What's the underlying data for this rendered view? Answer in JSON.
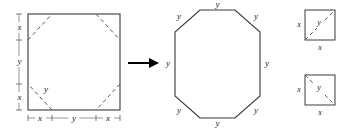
{
  "figure": {
    "colors": {
      "shape_stroke": "#3a3a3a",
      "dashed_stroke": "#5a5a5a",
      "axis_stroke": "#8a8a8a",
      "arrow": "#000000",
      "background": "#ffffff",
      "text": "#1a1a1a"
    }
  },
  "square_panel": {
    "name": "original-square",
    "vertical_axis": {
      "segments": [
        "x",
        "y",
        "x"
      ],
      "labels": {
        "top": "x",
        "middle": "y",
        "bottom": "x"
      }
    },
    "horizontal_axis": {
      "segments": [
        "x",
        "y",
        "x"
      ],
      "labels": {
        "left": "x",
        "middle": "y",
        "right": "x"
      }
    },
    "interior_label": "y",
    "corner_cuts": 4,
    "cut_style": "dashed"
  },
  "arrow": {
    "name": "transformation-arrow",
    "direction": "right",
    "symbol": "→"
  },
  "octagon_panel": {
    "name": "regular-octagon",
    "sides": 8,
    "side_labels": [
      "y",
      "y",
      "y",
      "y",
      "y",
      "y",
      "y",
      "y"
    ],
    "label_positions": [
      "top",
      "top-right",
      "right",
      "bottom-right",
      "bottom",
      "bottom-left",
      "left",
      "top-left"
    ]
  },
  "detail_squares": [
    {
      "name": "corner-detail-top",
      "left_label": "x",
      "bottom_label": "x",
      "hypotenuse_label": "y",
      "diagonal": "bottom-left-to-top-right"
    },
    {
      "name": "corner-detail-bottom",
      "left_label": "x",
      "bottom_label": "x",
      "hypotenuse_label": "y",
      "diagonal": "top-left-to-bottom-right"
    }
  ]
}
